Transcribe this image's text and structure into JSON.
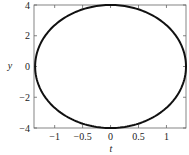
{
  "chart_data": {
    "type": "line",
    "title": "",
    "xlabel": "t",
    "ylabel": "y",
    "xlim": [
      -1.37,
      1.35
    ],
    "ylim": [
      -4,
      4
    ],
    "xticks": [
      -1,
      -0.5,
      0,
      0.5,
      1
    ],
    "xtick_labels": [
      "−1",
      "−0.5",
      "0",
      "0.5",
      "1"
    ],
    "yticks": [
      -4,
      -2,
      0,
      2,
      4
    ],
    "ytick_labels": [
      "−4",
      "−2",
      "0",
      "2",
      "4"
    ],
    "grid": false,
    "legend": null,
    "series": [
      {
        "name": "ellipse",
        "shape": "closed curve",
        "center": [
          0,
          0
        ],
        "x_semi_axis": 1.35,
        "y_semi_axis": 4,
        "points": [
          [
            1.35,
            0
          ],
          [
            1.17,
            2
          ],
          [
            0.68,
            3.46
          ],
          [
            0,
            4
          ],
          [
            -0.68,
            3.46
          ],
          [
            -1.17,
            2
          ],
          [
            -1.35,
            0
          ],
          [
            -1.17,
            -2
          ],
          [
            -0.68,
            -3.46
          ],
          [
            0,
            -4
          ],
          [
            0.68,
            -3.46
          ],
          [
            1.17,
            -2
          ],
          [
            1.35,
            0
          ]
        ],
        "color": "#111111"
      }
    ]
  },
  "axes": {
    "xlabel": "t",
    "ylabel": "y"
  }
}
